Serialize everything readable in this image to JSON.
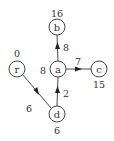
{
  "diagram": {
    "type": "shortest-path-tree",
    "nodes": [
      {
        "id": "b",
        "label": "b",
        "distance": "16",
        "cx": 57,
        "cy": 27,
        "dist_x": 57,
        "dist_y": 13
      },
      {
        "id": "a",
        "label": "a",
        "distance": "8",
        "cx": 58,
        "cy": 69,
        "dist_x": 43,
        "dist_y": 70
      },
      {
        "id": "c",
        "label": "c",
        "distance": "15",
        "cx": 99,
        "cy": 69,
        "dist_x": 99,
        "dist_y": 84
      },
      {
        "id": "r",
        "label": "r",
        "distance": "0",
        "cx": 17,
        "cy": 69,
        "dist_x": 17,
        "dist_y": 53
      },
      {
        "id": "d",
        "label": "d",
        "distance": "6",
        "cx": 57,
        "cy": 114,
        "dist_x": 57,
        "dist_y": 130
      }
    ],
    "edges": [
      {
        "from": "a",
        "to": "b",
        "weight": "8",
        "label_x": 66,
        "label_y": 47
      },
      {
        "from": "a",
        "to": "c",
        "weight": "7",
        "label_x": 78,
        "label_y": 61
      },
      {
        "from": "d",
        "to": "a",
        "weight": "2",
        "label_x": 66,
        "label_y": 93
      },
      {
        "from": "r",
        "to": "d",
        "weight": "6",
        "label_x": 29,
        "label_y": 108
      }
    ],
    "node_radius": 8
  }
}
